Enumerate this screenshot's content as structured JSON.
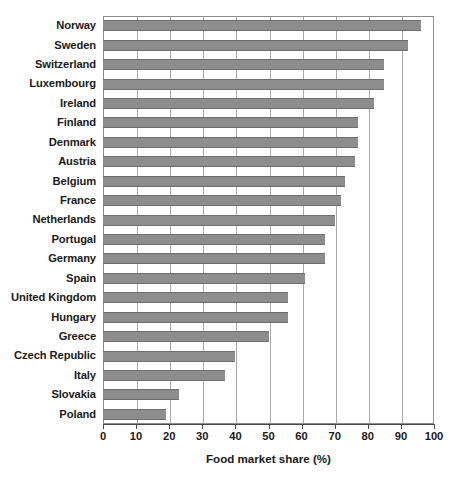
{
  "chart_data": {
    "type": "bar",
    "orientation": "horizontal",
    "title": "",
    "xlabel": "Food market share (%)",
    "ylabel": "",
    "xlim": [
      0,
      100
    ],
    "xticks": [
      0,
      10,
      20,
      30,
      40,
      50,
      60,
      70,
      80,
      90,
      100
    ],
    "grid": true,
    "legend": false,
    "bar_color": "#8d8d8d",
    "categories": [
      "Norway",
      "Sweden",
      "Switzerland",
      "Luxembourg",
      "Ireland",
      "Finland",
      "Denmark",
      "Austria",
      "Belgium",
      "France",
      "Netherlands",
      "Portugal",
      "Germany",
      "Spain",
      "United Kingdom",
      "Hungary",
      "Greece",
      "Czech Republic",
      "Italy",
      "Slovakia",
      "Poland"
    ],
    "values": [
      96,
      92,
      85,
      85,
      82,
      77,
      77,
      76,
      73,
      72,
      70,
      67,
      67,
      61,
      56,
      56,
      50,
      40,
      37,
      23,
      19
    ]
  }
}
